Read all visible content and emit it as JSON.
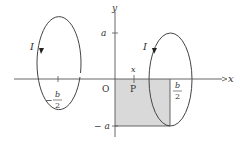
{
  "diagram": {
    "axes": {
      "x_label": "x",
      "y_label": "y",
      "origin_label": "O",
      "tick_a": "a",
      "tick_neg_a": "− a"
    },
    "loops": [
      {
        "name": "left-loop",
        "current_label": "I",
        "center_label_sign": "−",
        "center_label_num": "b",
        "center_label_den": "2",
        "direction": "counterclockwise-from-left"
      },
      {
        "name": "right-loop",
        "current_label": "I",
        "center_label_num": "b",
        "center_label_den": "2",
        "direction": "counterclockwise-from-left"
      }
    ],
    "point": {
      "label": "P",
      "coord_label": "x"
    },
    "shaded_region": {
      "x_from": "0",
      "x_to": "b/2",
      "y_from": "-a",
      "y_to": "0"
    },
    "colors": {
      "line": "#444444",
      "shade": "#d8d8d8",
      "background": "#ffffff"
    }
  }
}
